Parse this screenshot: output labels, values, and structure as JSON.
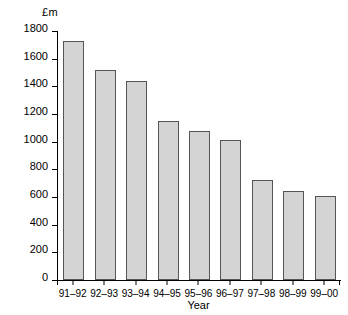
{
  "chart_data": {
    "type": "bar",
    "title": "",
    "subtitle": "",
    "xlabel": "Year",
    "ylabel": "£m",
    "unit_label": "£m",
    "categories": [
      "91–92",
      "92–93",
      "93–94",
      "94–95",
      "95–96",
      "96–97",
      "97–98",
      "98–99",
      "99–00"
    ],
    "values": [
      1730,
      1520,
      1440,
      1150,
      1080,
      1010,
      720,
      640,
      605
    ],
    "ylim": [
      0,
      1800
    ],
    "ytick_values": [
      0,
      200,
      400,
      600,
      800,
      1000,
      1200,
      1400,
      1600,
      1800
    ],
    "ytick_labels": [
      "0",
      "200",
      "400",
      "600",
      "800",
      "1000",
      "1200",
      "1400",
      "1600",
      "1800"
    ],
    "grid": false,
    "legend": null,
    "legend_position": "none",
    "annotations": [],
    "series": [
      {
        "name": "Amount",
        "values": [
          1730,
          1520,
          1440,
          1150,
          1080,
          1010,
          720,
          640,
          605
        ]
      }
    ],
    "colors": {
      "bar_fill": "#d4d4d4",
      "bar_border": "#555555",
      "axis": "#000000",
      "text": "#000000",
      "background": "#ffffff"
    }
  }
}
